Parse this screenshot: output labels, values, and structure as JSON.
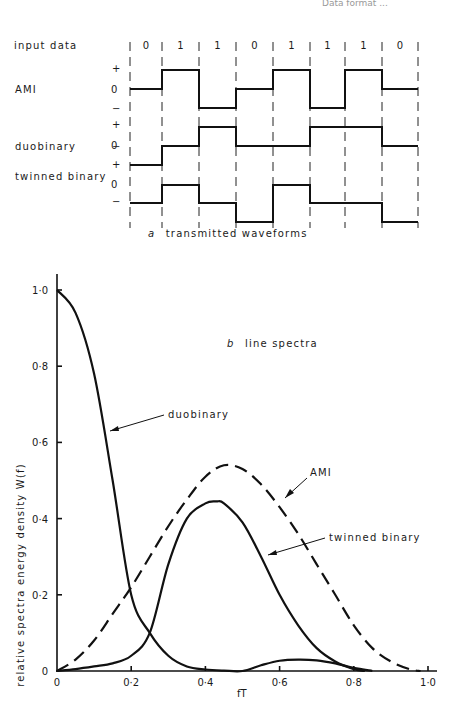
{
  "header_fragment": "Data format ...",
  "panel_a": {
    "caption_letter": "a",
    "caption_text": "transmitted waveforms",
    "row_labels": {
      "input": "input data",
      "ami": "AMI",
      "duobinary": "duobinary",
      "twinned": "twinned binary"
    },
    "level_labels": {
      "plus": "+",
      "zero": "0",
      "minus": "−"
    },
    "input_bits": [
      "0",
      "1",
      "1",
      "0",
      "1",
      "1",
      "1",
      "0"
    ],
    "waveforms": {
      "AMI": [
        0,
        1,
        -1,
        0,
        1,
        -1,
        1,
        0
      ],
      "duobinary": [
        -1,
        0,
        1,
        0,
        0,
        1,
        1,
        0
      ],
      "twinned binary": [
        0,
        1,
        0,
        -1,
        1,
        0,
        0,
        -1
      ]
    }
  },
  "chart_data": {
    "type": "line",
    "title": "b line spectra",
    "title_letter": "b",
    "title_text": "line spectra",
    "xlabel": "fT",
    "ylabel": "relative spectra energy density W(f)",
    "xlim": [
      0,
      1.0
    ],
    "ylim": [
      0,
      1.0
    ],
    "x_ticks": [
      "0",
      "0·2",
      "0·4",
      "0·6",
      "0·8",
      "1·0"
    ],
    "y_ticks": [
      "0",
      "0·2",
      "0·4",
      "0·6",
      "0·8",
      "1·0"
    ],
    "grid": false,
    "legend": "inline annotations with leader lines",
    "series": [
      {
        "name": "duobinary",
        "style": "solid",
        "x": [
          0,
          0.05,
          0.1,
          0.15,
          0.2,
          0.25,
          0.3,
          0.35,
          0.4,
          0.45,
          0.5,
          0.55,
          0.6,
          0.65,
          0.7,
          0.75,
          0.8,
          0.85
        ],
        "y": [
          1.0,
          0.94,
          0.78,
          0.5,
          0.2,
          0.1,
          0.04,
          0.012,
          0.004,
          0.001,
          0.0,
          0.015,
          0.027,
          0.03,
          0.028,
          0.02,
          0.008,
          0.0
        ]
      },
      {
        "name": "AMI",
        "style": "dashed",
        "x": [
          0,
          0.05,
          0.1,
          0.15,
          0.2,
          0.25,
          0.3,
          0.35,
          0.4,
          0.45,
          0.5,
          0.55,
          0.6,
          0.65,
          0.7,
          0.75,
          0.8,
          0.85,
          0.9,
          0.95,
          0.98
        ],
        "y": [
          0.0,
          0.03,
          0.08,
          0.15,
          0.22,
          0.3,
          0.38,
          0.45,
          0.51,
          0.54,
          0.53,
          0.49,
          0.43,
          0.36,
          0.28,
          0.2,
          0.12,
          0.06,
          0.025,
          0.005,
          0.0
        ]
      },
      {
        "name": "twinned binary",
        "style": "solid",
        "x": [
          0,
          0.05,
          0.1,
          0.15,
          0.2,
          0.25,
          0.3,
          0.35,
          0.4,
          0.43,
          0.45,
          0.5,
          0.55,
          0.6,
          0.65,
          0.7,
          0.75,
          0.8,
          0.83
        ],
        "y": [
          0.0,
          0.005,
          0.012,
          0.02,
          0.04,
          0.1,
          0.28,
          0.4,
          0.44,
          0.445,
          0.44,
          0.39,
          0.3,
          0.2,
          0.12,
          0.06,
          0.025,
          0.005,
          0.0
        ]
      }
    ],
    "annotations": [
      {
        "text": "duobinary",
        "points_to": [
          0.18,
          0.62
        ]
      },
      {
        "text": "AMI",
        "points_to": [
          0.55,
          0.49
        ]
      },
      {
        "text": "twinned binary",
        "points_to": [
          0.55,
          0.32
        ]
      }
    ]
  }
}
